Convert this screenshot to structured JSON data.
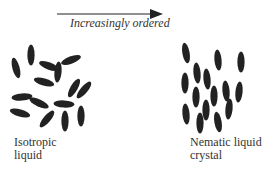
{
  "arrow": {
    "label": "Increasingly ordered",
    "direction": "right"
  },
  "phases": [
    {
      "name": "isotropic",
      "label_line1": "Isotropic",
      "label_line2": "liquid"
    },
    {
      "name": "nematic",
      "label_line1": "Nematic liquid",
      "label_line2": "crystal"
    }
  ],
  "colors": {
    "molecule": "#222222",
    "arrow": "#222222",
    "text": "#333333"
  },
  "molecules": {
    "isotropic": [
      {
        "cx": 16,
        "cy": 68,
        "rot": -15
      },
      {
        "cx": 31,
        "cy": 55,
        "rot": 0
      },
      {
        "cx": 49,
        "cy": 66,
        "rot": -70
      },
      {
        "cx": 58,
        "cy": 72,
        "rot": 5
      },
      {
        "cx": 71,
        "cy": 60,
        "rot": 70
      },
      {
        "cx": 44,
        "cy": 82,
        "rot": -75
      },
      {
        "cx": 74,
        "cy": 88,
        "rot": 30
      },
      {
        "cx": 84,
        "cy": 90,
        "rot": 40
      },
      {
        "cx": 22,
        "cy": 97,
        "rot": 85
      },
      {
        "cx": 39,
        "cy": 103,
        "rot": -65
      },
      {
        "cx": 64,
        "cy": 104,
        "rot": -87
      },
      {
        "cx": 20,
        "cy": 113,
        "rot": -75
      },
      {
        "cx": 47,
        "cy": 119,
        "rot": 40
      },
      {
        "cx": 65,
        "cy": 121,
        "rot": 0
      },
      {
        "cx": 81,
        "cy": 116,
        "rot": 0
      }
    ],
    "nematic": [
      {
        "cx": 186,
        "cy": 53,
        "rot": -10
      },
      {
        "cx": 218,
        "cy": 60,
        "rot": -5
      },
      {
        "cx": 241,
        "cy": 62,
        "rot": 0
      },
      {
        "cx": 197,
        "cy": 73,
        "rot": -5
      },
      {
        "cx": 207,
        "cy": 79,
        "rot": -5
      },
      {
        "cx": 185,
        "cy": 83,
        "rot": 0
      },
      {
        "cx": 226,
        "cy": 91,
        "rot": -5
      },
      {
        "cx": 196,
        "cy": 97,
        "rot": 0
      },
      {
        "cx": 214,
        "cy": 96,
        "rot": 0
      },
      {
        "cx": 239,
        "cy": 92,
        "rot": 5
      },
      {
        "cx": 206,
        "cy": 110,
        "rot": 0
      },
      {
        "cx": 186,
        "cy": 114,
        "rot": -5
      },
      {
        "cx": 229,
        "cy": 109,
        "rot": 5
      },
      {
        "cx": 200,
        "cy": 123,
        "rot": 0
      },
      {
        "cx": 218,
        "cy": 122,
        "rot": -10
      }
    ]
  }
}
